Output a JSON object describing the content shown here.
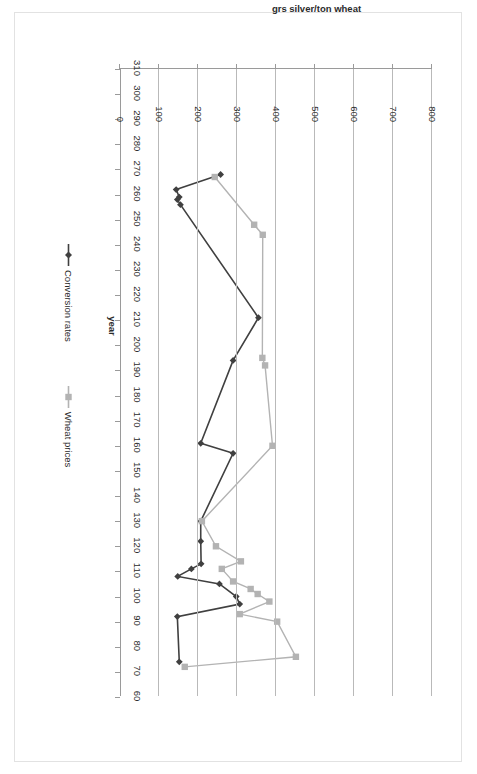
{
  "chart_data": {
    "type": "line",
    "title": "",
    "xlabel": "year",
    "ylabel": "grs silver/ton wheat",
    "orientation": "rotated-90deg-clockwise",
    "grid": true,
    "legend_position": "bottom",
    "xlim": [
      310,
      60
    ],
    "ylim": [
      0,
      800
    ],
    "x_ticks": [
      310,
      300,
      290,
      280,
      270,
      260,
      250,
      240,
      230,
      220,
      210,
      200,
      190,
      180,
      170,
      160,
      150,
      140,
      130,
      120,
      110,
      100,
      90,
      80,
      70,
      60
    ],
    "y_ticks": [
      0,
      100,
      200,
      300,
      400,
      500,
      600,
      700,
      800
    ],
    "series": [
      {
        "name": "Conversion rates",
        "color": "#404040",
        "marker": "diamond",
        "points": [
          {
            "x": 268,
            "y": 258
          },
          {
            "x": 262,
            "y": 144
          },
          {
            "x": 259,
            "y": 152
          },
          {
            "x": 258,
            "y": 147
          },
          {
            "x": 256,
            "y": 155
          },
          {
            "x": 211,
            "y": 355
          },
          {
            "x": 194,
            "y": 290
          },
          {
            "x": 161,
            "y": 207
          },
          {
            "x": 157,
            "y": 290
          },
          {
            "x": 130,
            "y": 207
          },
          {
            "x": 122,
            "y": 207
          },
          {
            "x": 113,
            "y": 208
          },
          {
            "x": 111,
            "y": 183
          },
          {
            "x": 108,
            "y": 148
          },
          {
            "x": 105,
            "y": 255
          },
          {
            "x": 100,
            "y": 298
          },
          {
            "x": 97,
            "y": 307
          },
          {
            "x": 92,
            "y": 147
          },
          {
            "x": 74,
            "y": 152
          }
        ]
      },
      {
        "name": "Wheat prices",
        "color": "#b3b3b3",
        "marker": "square",
        "points": [
          {
            "x": 267,
            "y": 243
          },
          {
            "x": 248,
            "y": 344
          },
          {
            "x": 244,
            "y": 366
          },
          {
            "x": 195,
            "y": 365
          },
          {
            "x": 192,
            "y": 372
          },
          {
            "x": 160,
            "y": 391
          },
          {
            "x": 130,
            "y": 210
          },
          {
            "x": 120,
            "y": 246
          },
          {
            "x": 114,
            "y": 310
          },
          {
            "x": 111,
            "y": 261
          },
          {
            "x": 106,
            "y": 290
          },
          {
            "x": 103,
            "y": 335
          },
          {
            "x": 101,
            "y": 353
          },
          {
            "x": 98,
            "y": 383
          },
          {
            "x": 93,
            "y": 307
          },
          {
            "x": 90,
            "y": 403
          },
          {
            "x": 76,
            "y": 451
          },
          {
            "x": 72,
            "y": 166
          }
        ]
      }
    ]
  }
}
